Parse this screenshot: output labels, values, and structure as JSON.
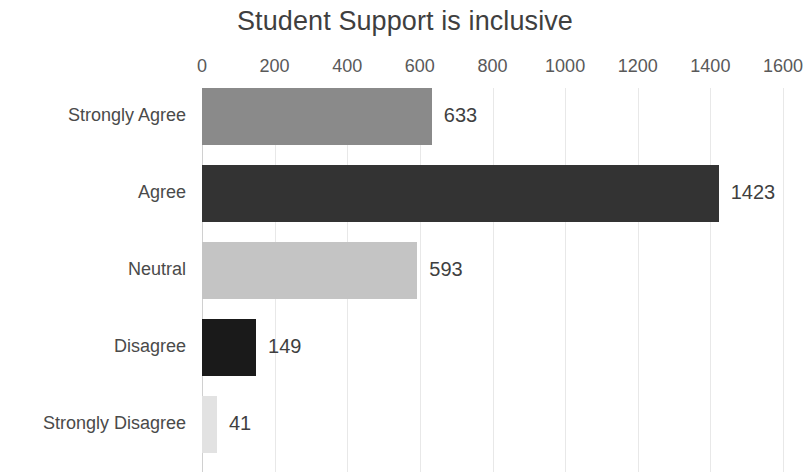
{
  "chart_data": {
    "type": "bar",
    "orientation": "horizontal",
    "title": "Student Support is inclusive",
    "xlabel": "",
    "ylabel": "",
    "categories": [
      "Strongly Agree",
      "Agree",
      "Neutral",
      "Disagree",
      "Strongly Disagree"
    ],
    "values": [
      633,
      1423,
      593,
      149,
      41
    ],
    "value_labels": [
      "633",
      "1423",
      "593",
      "149",
      "41"
    ],
    "bar_colors": [
      "#8a8a8a",
      "#333333",
      "#c4c4c4",
      "#1a1a1a",
      "#e2e2e2"
    ],
    "xlim": [
      0,
      1600
    ],
    "xticks": [
      0,
      200,
      400,
      600,
      800,
      1000,
      1200,
      1400,
      1600
    ],
    "xtick_labels": [
      "0",
      "200",
      "400",
      "600",
      "800",
      "1000",
      "1200",
      "1400",
      "1600"
    ],
    "grid": true,
    "grid_axis": "x",
    "legend": false,
    "background_color": "#ffffff",
    "text_color": "#404040"
  }
}
